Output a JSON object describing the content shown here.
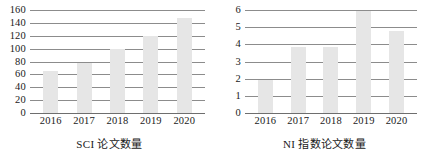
{
  "figure": {
    "background": "#ffffff",
    "bar_color": "#e6e6e6",
    "gridline_color": "#8c8c8c"
  },
  "chart_data": [
    {
      "type": "bar",
      "title": "",
      "caption": "SCI 论文数量",
      "xlabel": "",
      "ylabel": "",
      "categories": [
        "2016",
        "2017",
        "2018",
        "2019",
        "2020"
      ],
      "values": [
        65,
        78,
        100,
        120,
        148
      ],
      "ylim": [
        0,
        160
      ],
      "yticks": [
        0,
        20,
        40,
        60,
        80,
        100,
        120,
        140,
        160
      ],
      "ytick_labels": [
        "0",
        "20",
        "40",
        "60",
        "80",
        "100",
        "120",
        "140",
        "160"
      ],
      "grid": true,
      "legend": false,
      "bar_color": "#e6e6e6"
    },
    {
      "type": "bar",
      "title": "",
      "caption": "NI 指数论文数量",
      "xlabel": "",
      "ylabel": "",
      "categories": [
        "2016",
        "2017",
        "2018",
        "2019",
        "2020"
      ],
      "values": [
        1.9,
        3.85,
        3.85,
        5.95,
        4.8
      ],
      "ylim": [
        0,
        6
      ],
      "yticks": [
        0,
        1,
        2,
        3,
        4,
        5,
        6
      ],
      "ytick_labels": [
        "0",
        "1",
        "2",
        "3",
        "4",
        "5",
        "6"
      ],
      "grid": true,
      "legend": false,
      "bar_color": "#e6e6e6"
    }
  ]
}
